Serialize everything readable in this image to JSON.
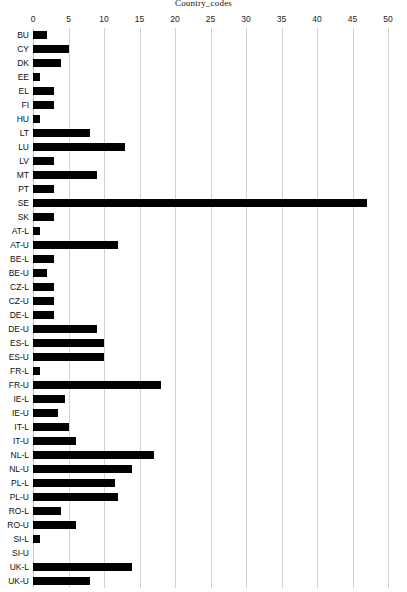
{
  "chart_data": {
    "type": "bar",
    "orientation": "horizontal",
    "title": "Country_codes",
    "xlabel": "",
    "ylabel": "",
    "xlim": [
      0,
      50
    ],
    "xticks": [
      0,
      5,
      10,
      15,
      20,
      25,
      30,
      35,
      40,
      45,
      50
    ],
    "grid": true,
    "legend": null,
    "bar_color": "#000000",
    "grid_color": "#d2d2d2",
    "categories": [
      "BU",
      "CY",
      "DK",
      "EE",
      "EL",
      "FI",
      "HU",
      "LT",
      "LU",
      "LV",
      "MT",
      "PT",
      "SE",
      "SK",
      "AT-L",
      "AT-U",
      "BE-L",
      "BE-U",
      "CZ-L",
      "CZ-U",
      "DE-L",
      "DE-U",
      "ES-L",
      "ES-U",
      "FR-L",
      "FR-U",
      "IE-L",
      "IE-U",
      "IT-L",
      "IT-U",
      "NL-L",
      "NL-U",
      "PL-L",
      "PL-U",
      "RO-L",
      "RO-U",
      "SI-L",
      "SI-U",
      "UK-L",
      "UK-U"
    ],
    "values": [
      2,
      5,
      4,
      1,
      3,
      3,
      1,
      8,
      13,
      3,
      9,
      3,
      47,
      3,
      1,
      12,
      3,
      2,
      3,
      3,
      3,
      9,
      10,
      10,
      1,
      18,
      4.5,
      3.5,
      5,
      6,
      17,
      14,
      11.5,
      12,
      4,
      6,
      1,
      0,
      14,
      8
    ]
  }
}
